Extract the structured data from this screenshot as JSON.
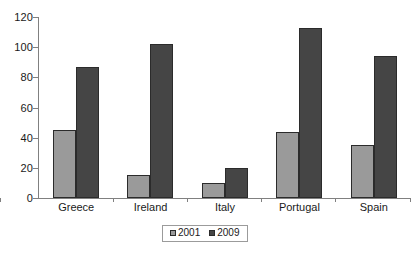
{
  "chart_data": {
    "type": "bar",
    "title": "",
    "xlabel": "",
    "ylabel": "",
    "categories": [
      "Greece",
      "Ireland",
      "Italy",
      "Portugal",
      "Spain"
    ],
    "series": [
      {
        "name": "2001",
        "color": "#9a9a9a",
        "values": [
          45,
          15,
          10,
          44,
          35
        ]
      },
      {
        "name": "2009",
        "color": "#454545",
        "values": [
          87,
          102,
          20,
          113,
          94
        ]
      }
    ],
    "ylim": [
      0,
      120
    ],
    "ytick_labels": [
      "0",
      "20",
      "40",
      "60",
      "80",
      "100",
      "120"
    ],
    "ytick_values": [
      0,
      20,
      40,
      60,
      80,
      100,
      120
    ],
    "grid": false,
    "legend_position": "bottom-center",
    "axis_color": "#808080",
    "bar_outline_color": "#2b2b2b",
    "background_color": "#ffffff"
  },
  "legend": {
    "entries": [
      {
        "label": "2001"
      },
      {
        "label": "2009"
      }
    ]
  }
}
